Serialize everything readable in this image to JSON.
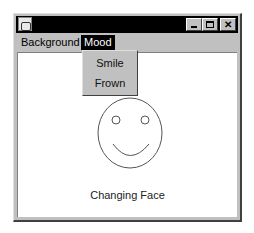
{
  "window": {
    "title": "",
    "icon": "java-cup-icon",
    "controls": {
      "minimize": "minimize-icon",
      "maximize": "maximize-icon",
      "close": "close-icon"
    }
  },
  "menubar": {
    "items": [
      {
        "label": "Background",
        "active": false
      },
      {
        "label": "Mood",
        "active": true
      }
    ]
  },
  "dropdown": {
    "items": [
      {
        "label": "Smile"
      },
      {
        "label": "Frown"
      }
    ]
  },
  "content": {
    "face_state": "smile",
    "caption": "Changing Face"
  },
  "colors": {
    "frame": "#c0c0c0",
    "titlebar": "#000000",
    "menu_active_bg": "#000000",
    "content_bg": "#ffffff"
  }
}
